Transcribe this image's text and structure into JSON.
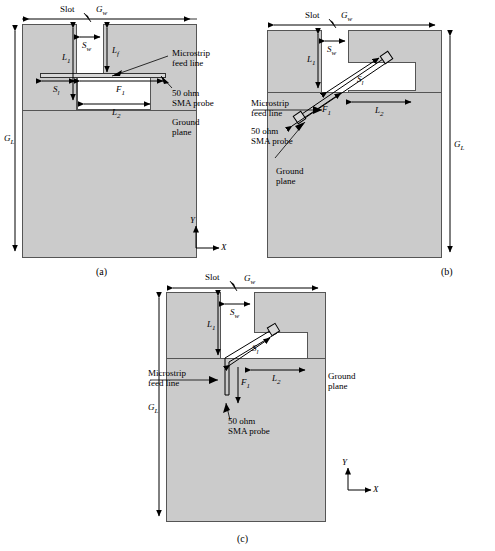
{
  "figure": {
    "type": "antenna-geometry-diagram",
    "panel_count": 3,
    "fill_color": "#cbcbcb",
    "line_color": "#000000"
  },
  "labels": {
    "slot": "Slot",
    "Gw": "G",
    "Gw_sub": "w",
    "GL": "G",
    "GL_sub": "L",
    "Sw": "S",
    "Sw_sub": "w",
    "Sl": "S",
    "Sl_sub": "l",
    "L1": "L",
    "L1_sub": "1",
    "L2": "L",
    "L2_sub": "2",
    "Lf": "L",
    "Lf_sub": "f",
    "F1": "F",
    "F1_sub": "1",
    "microstrip": "Microstrip",
    "feedline": "feed line",
    "sma_line1": "50 ohm",
    "sma_line2": "SMA probe",
    "ground_line1": "Ground",
    "ground_line2": "plane",
    "axis_x": "X",
    "axis_y": "Y"
  },
  "captions": {
    "a": "(a)",
    "b": "(b)",
    "c": "(c)"
  },
  "panels": [
    {
      "id": "a",
      "caption": "(a)",
      "feed_type": "straight-horizontal",
      "dimensions": [
        "G_w",
        "G_L",
        "S_w",
        "S_l",
        "L_1",
        "L_2",
        "L_f",
        "F_1"
      ],
      "annotations": [
        "Slot",
        "Microstrip feed line",
        "50 ohm SMA probe",
        "Ground plane"
      ],
      "has_axes": true
    },
    {
      "id": "b",
      "caption": "(b)",
      "feed_type": "diagonal",
      "dimensions": [
        "G_w",
        "G_L",
        "S_w",
        "S_l",
        "L_1",
        "L_2",
        "F_1"
      ],
      "annotations": [
        "Slot",
        "Microstrip feed line",
        "50 ohm SMA probe",
        "Ground plane"
      ],
      "has_axes": false
    },
    {
      "id": "c",
      "caption": "(c)",
      "feed_type": "bent-diagonal-vertical",
      "dimensions": [
        "G_w",
        "G_L",
        "S_w",
        "S_l",
        "L_1",
        "L_2",
        "F_1"
      ],
      "annotations": [
        "Slot",
        "Microstrip feed line",
        "50 ohm SMA probe",
        "Ground plane"
      ],
      "has_axes": true
    }
  ]
}
